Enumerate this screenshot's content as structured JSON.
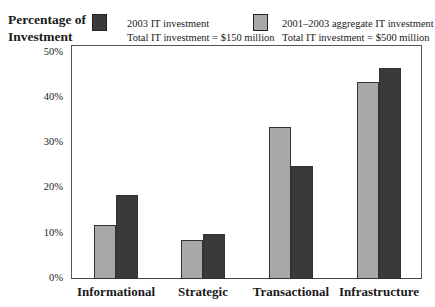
{
  "chart_data": {
    "type": "bar",
    "title": "",
    "ylabel": "Percentage of Investment",
    "xlabel": "",
    "ylim": [
      0,
      50
    ],
    "yticks": [
      "0%",
      "10%",
      "20%",
      "30%",
      "40%",
      "50%"
    ],
    "grid": false,
    "legend_position": "top",
    "categories": [
      "Informational",
      "Strategic",
      "Transactional",
      "Infrastructure"
    ],
    "series": [
      {
        "name": "2001–2003 aggregate IT investment",
        "note": "Total IT investment = $500 million",
        "color": "#a8a8a8",
        "values": [
          12,
          8.5,
          33.5,
          43.5
        ]
      },
      {
        "name": "2003 IT investment",
        "note": "Total IT investment = $150 million",
        "color": "#3a3a3a",
        "values": [
          18.5,
          10,
          25,
          46.5
        ]
      }
    ]
  },
  "labels": {
    "ylabel_line1": "Percentage of",
    "ylabel_line2": "Investment",
    "legend": [
      {
        "title": "2003 IT investment",
        "note": "Total IT investment = $150 million",
        "color": "#3a3a3a"
      },
      {
        "title": "2001–2003 aggregate IT investment",
        "note": "Total IT investment = $500 million",
        "color": "#a8a8a8"
      }
    ]
  }
}
